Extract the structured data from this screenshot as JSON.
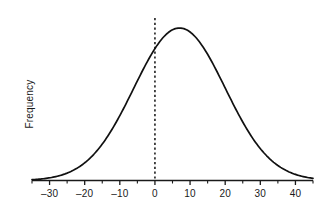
{
  "chart_data": {
    "type": "line",
    "title": "",
    "subtitle": "",
    "xlabel": "",
    "ylabel": "Frequency",
    "xlim": [
      -35,
      45
    ],
    "ylim": [
      0,
      1.05
    ],
    "grid": false,
    "legend": null,
    "xticks": [
      -30,
      -20,
      -10,
      0,
      10,
      20,
      30,
      40
    ],
    "xticklabels": [
      "–30",
      "–20",
      "–10",
      "0",
      "10",
      "20",
      "30",
      "40"
    ],
    "xminorticks": [
      -35,
      -25,
      -15,
      -5,
      5,
      15,
      25,
      35,
      45
    ],
    "yticks": [],
    "yticklabels": [],
    "series": [
      {
        "name": "frequency-distribution",
        "type": "line",
        "color": "#111111",
        "shape": "gaussian",
        "mean": 7,
        "stddev": 13,
        "peak_value": 1.0,
        "x": [
          -35,
          -32,
          -29,
          -26,
          -23,
          -20,
          -17,
          -14,
          -11,
          -8,
          -5,
          -2,
          1,
          4,
          7,
          10,
          13,
          16,
          19,
          22,
          25,
          28,
          31,
          34,
          37,
          40,
          43,
          45
        ],
        "y": [
          0.019,
          0.031,
          0.049,
          0.074,
          0.108,
          0.152,
          0.206,
          0.27,
          0.343,
          0.42,
          0.5,
          0.577,
          0.748,
          0.958,
          1.0,
          0.968,
          0.874,
          0.74,
          0.594,
          0.452,
          0.327,
          0.225,
          0.147,
          0.092,
          0.054,
          0.031,
          0.017,
          0.011
        ]
      }
    ],
    "annotations": [
      {
        "name": "zero-reference-line",
        "type": "vline",
        "x": 0,
        "style": "dashed",
        "color": "#111111",
        "label": ""
      }
    ]
  },
  "axis": {
    "ylabel_text": "Frequency"
  }
}
